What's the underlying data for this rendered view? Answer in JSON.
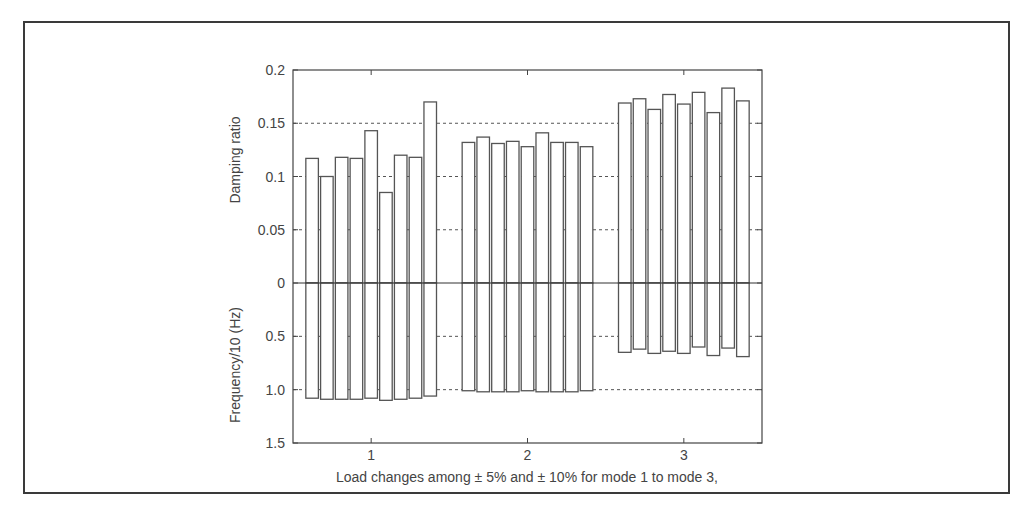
{
  "chart_data": {
    "type": "bar",
    "title": "",
    "xlabel": "Load changes among ± 5% and ± 10% for mode 1 to mode 3,",
    "ylabel_upper": "Damping ratio",
    "ylabel_lower": "Frequency/10 (Hz)",
    "categories": [
      "1",
      "2",
      "3"
    ],
    "xlim": [
      0.5,
      3.5
    ],
    "upper_ylim": [
      0,
      0.2
    ],
    "lower_ylim": [
      0,
      1.5
    ],
    "upper_yticks": [
      "0.2",
      "0.15",
      "0.1",
      "0.05",
      "0"
    ],
    "upper_ytick_values": [
      0.2,
      0.15,
      0.1,
      0.05,
      0
    ],
    "lower_yticks": [
      "0.5",
      "1.0",
      "1.5"
    ],
    "lower_ytick_values": [
      0.5,
      1.0,
      1.5
    ],
    "grid": "dashed horizontal at y ticks",
    "bars_per_group": 9,
    "series": [
      {
        "name": "Damping ratio (upward)",
        "groups": [
          [
            0.117,
            0.1,
            0.118,
            0.117,
            0.143,
            0.085,
            0.12,
            0.118,
            0.17
          ],
          [
            0.132,
            0.137,
            0.131,
            0.133,
            0.128,
            0.141,
            0.132,
            0.132,
            0.128
          ],
          [
            0.169,
            0.173,
            0.163,
            0.177,
            0.168,
            0.179,
            0.16,
            0.183,
            0.171
          ]
        ]
      },
      {
        "name": "Frequency/10 (Hz) (downward)",
        "groups": [
          [
            1.08,
            1.09,
            1.09,
            1.09,
            1.08,
            1.1,
            1.09,
            1.08,
            1.06
          ],
          [
            1.01,
            1.02,
            1.02,
            1.02,
            1.01,
            1.02,
            1.02,
            1.02,
            1.01
          ],
          [
            0.65,
            0.62,
            0.66,
            0.64,
            0.66,
            0.6,
            0.68,
            0.61,
            0.69
          ]
        ]
      }
    ]
  },
  "colors": {
    "bar_fill": "#ffffff",
    "bar_stroke": "#555555",
    "axis": "#444444",
    "grid": "#555555",
    "frame": "#3a3a3a"
  }
}
